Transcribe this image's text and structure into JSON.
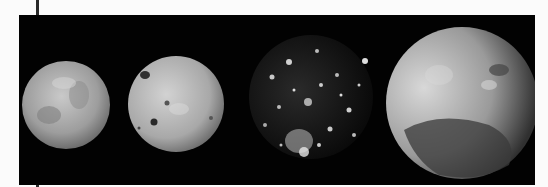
{
  "image": {
    "subject": "Four Galilean moons photographed against black space",
    "background_color": "#020202",
    "page_color": "#fbfbfb",
    "moons": [
      {
        "name": "moon-1",
        "appearance": "uniform grey mottled disk",
        "cx": 47,
        "cy": 90,
        "r": 44
      },
      {
        "name": "moon-2",
        "appearance": "light grey disk with dark crater spots",
        "cx": 157,
        "cy": 89,
        "r": 48
      },
      {
        "name": "moon-3",
        "appearance": "dark disk covered in bright crater spots",
        "cx": 292,
        "cy": 82,
        "r": 62
      },
      {
        "name": "moon-4",
        "appearance": "large grey disk, lit from left, dark region at lower half",
        "cx": 443,
        "cy": 88,
        "r": 76
      }
    ]
  }
}
